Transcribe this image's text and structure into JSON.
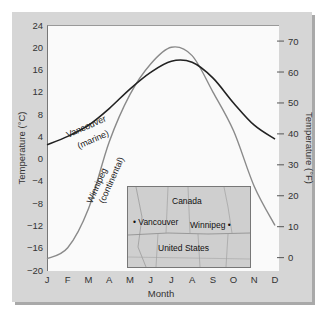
{
  "chart_data": {
    "type": "line",
    "title": "",
    "xlabel": "Month",
    "ylabel": "Temperature (°C)",
    "ylabel_right": "Temperature (°F)",
    "categories": [
      "J",
      "F",
      "M",
      "A",
      "M",
      "J",
      "J",
      "A",
      "S",
      "O",
      "N",
      "D"
    ],
    "ylim": [
      -20,
      24
    ],
    "yticks_left": [
      24,
      20,
      16,
      12,
      8,
      4,
      0,
      -4,
      -8,
      -12,
      -16,
      -20
    ],
    "yticks_right": [
      70,
      60,
      50,
      40,
      30,
      20,
      10,
      0
    ],
    "grid": false,
    "series": [
      {
        "name": "Vancouver (marine)",
        "color": "#222222",
        "values": [
          2.5,
          4,
          6,
          9,
          12.5,
          15.5,
          17.5,
          17.3,
          14.5,
          10,
          6,
          3.5
        ]
      },
      {
        "name": "Winnipeg (continental)",
        "color": "#8a8a8a",
        "values": [
          -18,
          -16,
          -9,
          3,
          11.5,
          17,
          20,
          18.5,
          12,
          5,
          -5,
          -12
        ]
      }
    ],
    "annotations": [
      "Vancouver (marine)",
      "Winnipeg (continental)"
    ]
  },
  "labels": {
    "vancouver_line1": "Vancouver",
    "vancouver_line2": "(marine)",
    "winnipeg_line1": "Winnipeg",
    "winnipeg_line2": "(continental)"
  },
  "map": {
    "country_top": "Canada",
    "country_bottom": "United States",
    "city1": "Vancouver",
    "city2": "Winnipeg"
  }
}
